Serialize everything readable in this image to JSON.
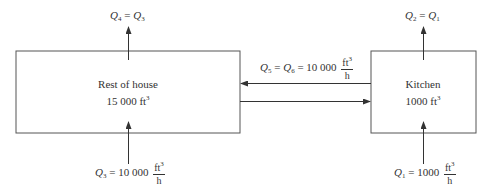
{
  "diagram": {
    "type": "flow-diagram",
    "nodes": [
      {
        "id": "rest_of_house",
        "name": "Rest of house",
        "volume_value": "15 000",
        "volume_unit": "ft",
        "volume_exp": "3"
      },
      {
        "id": "kitchen",
        "name": "Kitchen",
        "volume_value": "1000",
        "volume_unit": "ft",
        "volume_exp": "3"
      }
    ],
    "flows": {
      "q4": {
        "var": "Q",
        "sub": "4",
        "eq": " = ",
        "rhs_var": "Q",
        "rhs_sub": "3"
      },
      "q2": {
        "var": "Q",
        "sub": "2",
        "eq": " = ",
        "rhs_var": "Q",
        "rhs_sub": "1"
      },
      "q5q6": {
        "var": "Q",
        "sub": "5",
        "eq": " = ",
        "rhs_var": "Q",
        "rhs_sub": "6",
        "eq2": " = ",
        "value": "10 000",
        "unit_num": "ft",
        "unit_exp": "3",
        "unit_den": "h"
      },
      "q3": {
        "var": "Q",
        "sub": "3",
        "eq": " = ",
        "value": "10 000",
        "unit_num": "ft",
        "unit_exp": "3",
        "unit_den": "h"
      },
      "q1": {
        "var": "Q",
        "sub": "1",
        "eq": " = ",
        "value": "1000",
        "unit_num": "ft",
        "unit_exp": "3",
        "unit_den": "h"
      }
    },
    "edges": [
      {
        "from": "outside",
        "to": "rest_of_house",
        "label": "Q3"
      },
      {
        "from": "rest_of_house",
        "to": "outside",
        "label": "Q4"
      },
      {
        "from": "outside",
        "to": "kitchen",
        "label": "Q1"
      },
      {
        "from": "kitchen",
        "to": "outside",
        "label": "Q2"
      },
      {
        "from": "kitchen",
        "to": "rest_of_house",
        "label": "Q5"
      },
      {
        "from": "rest_of_house",
        "to": "kitchen",
        "label": "Q6"
      }
    ]
  }
}
